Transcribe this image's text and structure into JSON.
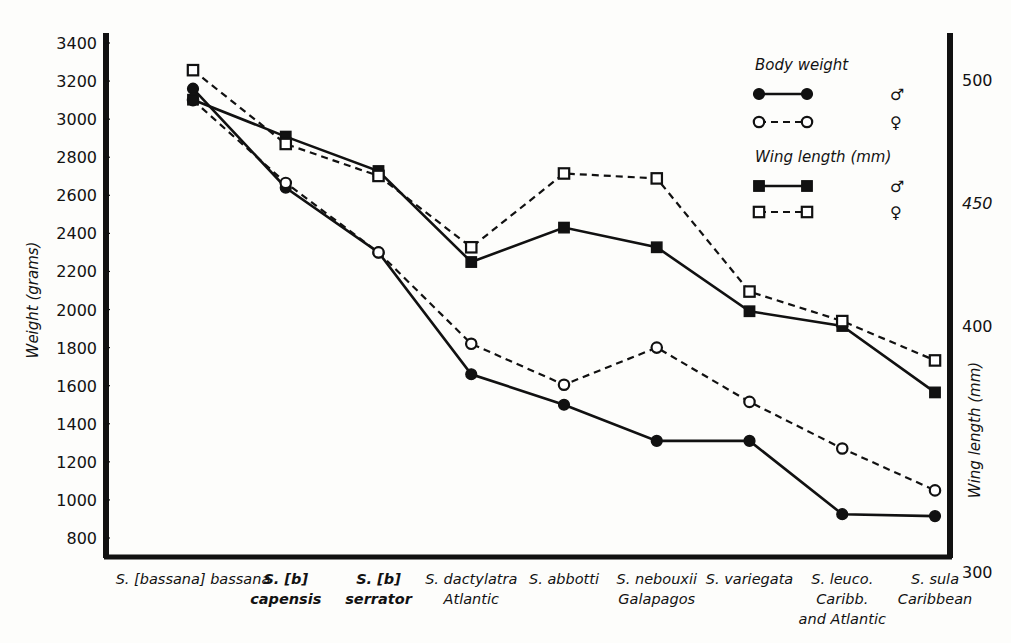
{
  "chart_data": {
    "type": "line",
    "title": "",
    "xlabel": "",
    "ylabel": "Weight (grams)",
    "y2label": "Wing length (mm)",
    "ylim": [
      800,
      3400
    ],
    "y2lim": [
      300,
      500
    ],
    "grid": false,
    "legend_position": "top-right",
    "categories": [
      "S. [bassana] bassana",
      "S. [b] capensis",
      "S. [b] serrator",
      "S. dactylatra Atlantic",
      "S. abbotti",
      "S. nebouxii Galapagos",
      "S. variegata",
      "S. leuco. Caribb. and Atlantic",
      "S. sula Caribbean"
    ],
    "category_lines": [
      [
        "S. [bassana] bassana"
      ],
      [
        "S. [b]",
        "capensis"
      ],
      [
        "S. [b]",
        "serrator"
      ],
      [
        "S. dactylatra",
        "Atlantic"
      ],
      [
        "S. abbotti"
      ],
      [
        "S. nebouxii",
        "Galapagos"
      ],
      [
        "S. variegata"
      ],
      [
        "S. leuco.",
        "Caribb.",
        "and  Atlantic"
      ],
      [
        "S. sula",
        "Caribbean"
      ]
    ],
    "yticks": [
      800,
      1000,
      1200,
      1400,
      1600,
      1800,
      2000,
      2200,
      2400,
      2600,
      2800,
      3000,
      3200,
      3400
    ],
    "y2ticks": [
      300,
      400,
      450,
      500
    ],
    "series": [
      {
        "name": "Body weight male",
        "axis": "left",
        "marker": "filled-circle",
        "line": "solid",
        "values": [
          3160,
          2640,
          2300,
          1660,
          1500,
          1310,
          1310,
          925,
          915
        ]
      },
      {
        "name": "Body weight female",
        "axis": "left",
        "marker": "open-circle",
        "line": "dashed",
        "values": [
          3100,
          2665,
          2300,
          1820,
          1605,
          1800,
          1515,
          1270,
          1050
        ]
      },
      {
        "name": "Wing length male",
        "axis": "right",
        "marker": "filled-square",
        "line": "solid",
        "values": [
          492,
          477,
          463,
          426,
          440,
          432,
          406,
          400,
          373
        ]
      },
      {
        "name": "Wing length female",
        "axis": "right",
        "marker": "open-square",
        "line": "dashed",
        "values": [
          504,
          474,
          461,
          432,
          462,
          460,
          414,
          402,
          386
        ]
      }
    ]
  },
  "legend": {
    "group1_title": "Body weight",
    "group2_title": "Wing length (mm)",
    "male_symbol": "♂",
    "female_symbol": "♀",
    "entries": [
      {
        "group": "Body weight",
        "marker": "filled-circle",
        "line": "solid",
        "symbol": "♂"
      },
      {
        "group": "Body weight",
        "marker": "open-circle",
        "line": "dashed",
        "symbol": "♀"
      },
      {
        "group": "Wing length (mm)",
        "marker": "filled-square",
        "line": "solid",
        "symbol": "♂"
      },
      {
        "group": "Wing length (mm)",
        "marker": "open-square",
        "line": "dashed",
        "symbol": "♀"
      }
    ]
  },
  "axes": {
    "left_title": "Weight (grams)",
    "right_title": "Wing length (mm)"
  },
  "colors": {
    "ink": "#111111",
    "paper": "#fdfdfb"
  }
}
